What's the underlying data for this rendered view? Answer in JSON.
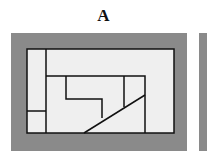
{
  "panel": {
    "label": "A",
    "outer_color": "#8a8a8a",
    "inner_color": "#efefef",
    "line_color": "#111111"
  }
}
